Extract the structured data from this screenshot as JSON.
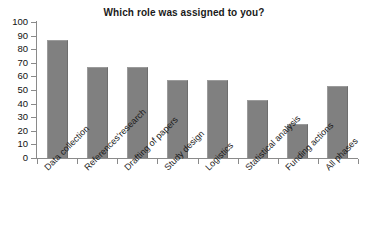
{
  "chart_data": {
    "type": "bar",
    "title": "Which role was assigned to you?",
    "xlabel": "",
    "ylabel": "",
    "ylim": [
      0,
      100
    ],
    "yticks": [
      0,
      10,
      20,
      30,
      40,
      50,
      60,
      70,
      80,
      90,
      100
    ],
    "grid": false,
    "legend": false,
    "bar_color": "#808080",
    "categories": [
      "Data collection",
      "References'research",
      "Drafting of papers",
      "Study design",
      "Logistics",
      "Statistical analysis",
      "Funding actions",
      "All phases"
    ],
    "values": [
      87,
      67,
      67,
      57,
      57,
      43,
      25,
      53
    ]
  },
  "axes": {
    "y_tick_labels": [
      "100",
      "90",
      "80",
      "70",
      "60",
      "50",
      "40",
      "30",
      "20",
      "10",
      "0"
    ]
  }
}
